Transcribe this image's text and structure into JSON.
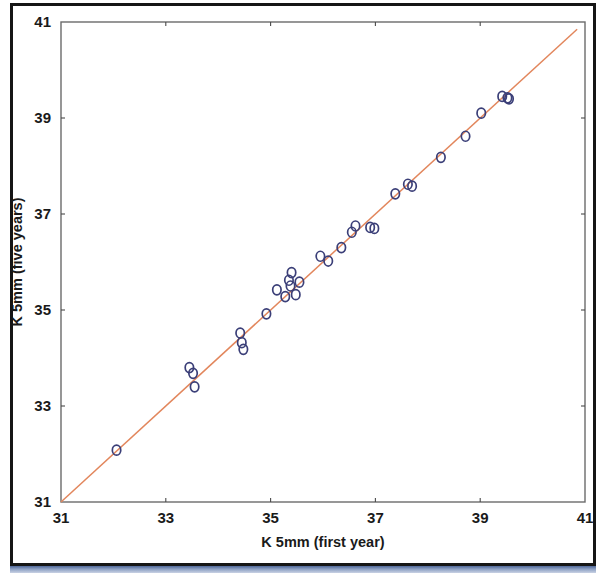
{
  "figure": {
    "background_color": "#ffffff",
    "frame_color": "#151515",
    "plot_border_color": "#6b6b6b"
  },
  "chart_data": {
    "type": "scatter",
    "title": "",
    "subtitle": "",
    "xlabel": "K 5mm (first year)",
    "ylabel": "K 5mm (five years)",
    "xlim": [
      31,
      41
    ],
    "ylim": [
      31,
      41
    ],
    "xticks": [
      31,
      33,
      35,
      37,
      39,
      41
    ],
    "yticks": [
      31,
      33,
      35,
      37,
      39,
      41
    ],
    "xtick_labels": [
      "31",
      "33",
      "35",
      "37",
      "39",
      "41"
    ],
    "ytick_labels": [
      "31",
      "33",
      "35",
      "37",
      "39",
      "41"
    ],
    "grid": false,
    "legend": null,
    "legend_position": "none",
    "marker_style": "open-circle",
    "marker_color": "#3b3f78",
    "marker_size": 7,
    "series": [
      {
        "name": "K 5mm first year vs five years",
        "points": [
          [
            32.06,
            32.08
          ],
          [
            33.45,
            33.8
          ],
          [
            33.52,
            33.68
          ],
          [
            33.55,
            33.4
          ],
          [
            34.42,
            34.52
          ],
          [
            34.45,
            34.32
          ],
          [
            34.48,
            34.18
          ],
          [
            34.92,
            34.92
          ],
          [
            35.12,
            35.42
          ],
          [
            35.28,
            35.28
          ],
          [
            35.35,
            35.62
          ],
          [
            35.38,
            35.5
          ],
          [
            35.4,
            35.78
          ],
          [
            35.48,
            35.32
          ],
          [
            35.55,
            35.58
          ],
          [
            35.95,
            36.12
          ],
          [
            36.1,
            36.02
          ],
          [
            36.35,
            36.3
          ],
          [
            36.55,
            36.62
          ],
          [
            36.62,
            36.75
          ],
          [
            36.9,
            36.72
          ],
          [
            36.98,
            36.7
          ],
          [
            37.38,
            37.42
          ],
          [
            37.62,
            37.62
          ],
          [
            37.7,
            37.58
          ],
          [
            38.25,
            38.18
          ],
          [
            38.72,
            38.62
          ],
          [
            39.02,
            39.1
          ],
          [
            39.42,
            39.45
          ],
          [
            39.52,
            39.42
          ],
          [
            39.55,
            39.4
          ]
        ]
      }
    ],
    "fit_line": {
      "name": "identity / regression line",
      "color": "#e2865c",
      "from": [
        31.0,
        31.0
      ],
      "to": [
        40.85,
        40.85
      ]
    }
  }
}
